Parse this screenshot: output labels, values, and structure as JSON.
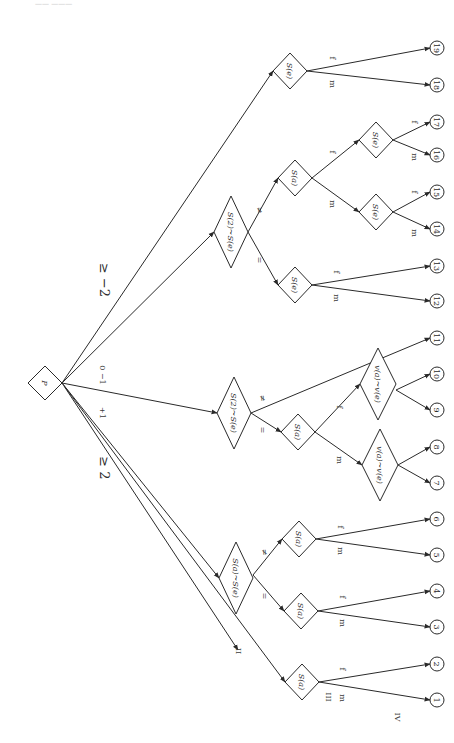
{
  "header": {
    "text": "—— ———"
  },
  "root": {
    "id": "P",
    "label": "P",
    "cx": 45,
    "cy": 383,
    "r": 17
  },
  "root_edge_labels": [
    {
      "text": "≥ −2",
      "x": 100,
      "y": 280,
      "size": "big"
    },
    {
      "text": "0  −1",
      "x": 100,
      "y": 375,
      "size": "small"
    },
    {
      "text": "+1",
      "x": 100,
      "y": 413,
      "size": "small"
    },
    {
      "text": "≥ 2",
      "x": 100,
      "y": 468,
      "size": "big"
    }
  ],
  "decision_nodes": [
    {
      "id": "n_top",
      "label": "S(e)",
      "cx": 290,
      "cy": 71,
      "rx": 17,
      "ry": 18
    },
    {
      "id": "n_upper_cmp",
      "label": "S(2)~S(e)",
      "cx": 231,
      "cy": 232,
      "rx": 17,
      "ry": 36
    },
    {
      "id": "n_upper_sa",
      "label": "S(a)",
      "cx": 295,
      "cy": 178,
      "rx": 17,
      "ry": 18
    },
    {
      "id": "n_upper_se1",
      "label": "S(e)",
      "cx": 376,
      "cy": 140,
      "rx": 17,
      "ry": 18
    },
    {
      "id": "n_upper_se2",
      "label": "S(e)",
      "cx": 376,
      "cy": 212,
      "rx": 17,
      "ry": 18
    },
    {
      "id": "n_upper_se3",
      "label": "S(e)",
      "cx": 295,
      "cy": 285,
      "rx": 17,
      "ry": 18
    },
    {
      "id": "n_mid_cmp",
      "label": "S(2)~S(e)",
      "cx": 234,
      "cy": 413,
      "rx": 17,
      "ry": 36
    },
    {
      "id": "n_mid_sa",
      "label": "S(a)",
      "cx": 298,
      "cy": 432,
      "rx": 17,
      "ry": 18
    },
    {
      "id": "n_mid_v1",
      "label": "v(a)~v(e)",
      "cx": 378,
      "cy": 384,
      "rx": 18,
      "ry": 36
    },
    {
      "id": "n_mid_v2",
      "label": "v(a)~v(e)",
      "cx": 380,
      "cy": 465,
      "rx": 18,
      "ry": 36
    },
    {
      "id": "n_low_cmp",
      "label": "S(a)~S(e)",
      "cx": 236,
      "cy": 578,
      "rx": 17,
      "ry": 36
    },
    {
      "id": "n_low_sa1",
      "label": "S(a)",
      "cx": 299,
      "cy": 539,
      "rx": 17,
      "ry": 18
    },
    {
      "id": "n_low_sa2",
      "label": "S(a)",
      "cx": 301,
      "cy": 611,
      "rx": 17,
      "ry": 18
    },
    {
      "id": "n_bottom",
      "label": "S(a)",
      "cx": 302,
      "cy": 682,
      "rx": 17,
      "ry": 18
    }
  ],
  "leaves": [
    {
      "id": "19",
      "cx": 437,
      "cy": 48
    },
    {
      "id": "18",
      "cx": 437,
      "cy": 85
    },
    {
      "id": "17",
      "cx": 437,
      "cy": 122
    },
    {
      "id": "16",
      "cx": 437,
      "cy": 155
    },
    {
      "id": "15",
      "cx": 437,
      "cy": 192
    },
    {
      "id": "14",
      "cx": 437,
      "cy": 229
    },
    {
      "id": "13",
      "cx": 437,
      "cy": 266
    },
    {
      "id": "12",
      "cx": 437,
      "cy": 301
    },
    {
      "id": "11",
      "cx": 437,
      "cy": 338
    },
    {
      "id": "10",
      "cx": 437,
      "cy": 374
    },
    {
      "id": "9",
      "cx": 437,
      "cy": 410
    },
    {
      "id": "8",
      "cx": 437,
      "cy": 447
    },
    {
      "id": "7",
      "cx": 437,
      "cy": 483
    },
    {
      "id": "6",
      "cx": 437,
      "cy": 519
    },
    {
      "id": "5",
      "cx": 437,
      "cy": 555
    },
    {
      "id": "4",
      "cx": 437,
      "cy": 591
    },
    {
      "id": "3",
      "cx": 437,
      "cy": 627
    },
    {
      "id": "2",
      "cx": 437,
      "cy": 664
    },
    {
      "id": "1",
      "cx": 437,
      "cy": 700
    }
  ],
  "edges": [
    {
      "from": [
        62,
        383
      ],
      "to": [
        273,
        71
      ]
    },
    {
      "from": [
        62,
        383
      ],
      "to": [
        214,
        232
      ]
    },
    {
      "from": [
        62,
        383
      ],
      "to": [
        217,
        413
      ]
    },
    {
      "from": [
        62,
        383
      ],
      "to": [
        219,
        578
      ]
    },
    {
      "from": [
        62,
        383
      ],
      "to": [
        285,
        682
      ]
    },
    {
      "from": [
        64,
        386
      ],
      "to": [
        238,
        650
      ]
    },
    {
      "from": [
        307,
        71
      ],
      "to": [
        430,
        48
      ],
      "label": "f",
      "lx": 330,
      "ly": 58
    },
    {
      "from": [
        307,
        71
      ],
      "to": [
        430,
        85
      ],
      "label": "m",
      "lx": 330,
      "ly": 84
    },
    {
      "from": [
        248,
        232
      ],
      "to": [
        278,
        178
      ],
      "label": "≠",
      "lx": 257,
      "ly": 210
    },
    {
      "from": [
        248,
        232
      ],
      "to": [
        278,
        285
      ],
      "label": "=",
      "lx": 257,
      "ly": 260
    },
    {
      "from": [
        312,
        178
      ],
      "to": [
        359,
        140
      ],
      "label": "f",
      "lx": 330,
      "ly": 152
    },
    {
      "from": [
        312,
        178
      ],
      "to": [
        359,
        212
      ],
      "label": "m",
      "lx": 330,
      "ly": 204
    },
    {
      "from": [
        393,
        140
      ],
      "to": [
        430,
        122
      ],
      "label": "f",
      "lx": 412,
      "ly": 122
    },
    {
      "from": [
        393,
        140
      ],
      "to": [
        430,
        155
      ],
      "label": "m",
      "lx": 412,
      "ly": 157
    },
    {
      "from": [
        393,
        212
      ],
      "to": [
        430,
        192
      ],
      "label": "f",
      "lx": 412,
      "ly": 192
    },
    {
      "from": [
        393,
        212
      ],
      "to": [
        430,
        229
      ],
      "label": "m",
      "lx": 412,
      "ly": 233
    },
    {
      "from": [
        312,
        285
      ],
      "to": [
        430,
        266
      ],
      "label": "f",
      "lx": 334,
      "ly": 272
    },
    {
      "from": [
        312,
        285
      ],
      "to": [
        430,
        301
      ],
      "label": "m",
      "lx": 334,
      "ly": 298
    },
    {
      "from": [
        251,
        413
      ],
      "to": [
        430,
        338
      ],
      "label": "≠",
      "lx": 260,
      "ly": 398
    },
    {
      "from": [
        251,
        413
      ],
      "to": [
        281,
        432
      ],
      "label": "=",
      "lx": 260,
      "ly": 430
    },
    {
      "from": [
        315,
        432
      ],
      "to": [
        360,
        384
      ],
      "label": "f",
      "lx": 337,
      "ly": 407
    },
    {
      "from": [
        315,
        432
      ],
      "to": [
        362,
        465
      ],
      "label": "m",
      "lx": 337,
      "ly": 460
    },
    {
      "from": [
        396,
        390
      ],
      "to": [
        430,
        374
      ]
    },
    {
      "from": [
        396,
        390
      ],
      "to": [
        430,
        410
      ]
    },
    {
      "from": [
        398,
        465
      ],
      "to": [
        430,
        447
      ]
    },
    {
      "from": [
        398,
        465
      ],
      "to": [
        430,
        483
      ]
    },
    {
      "from": [
        253,
        575
      ],
      "to": [
        282,
        539
      ],
      "label": "≠",
      "lx": 262,
      "ly": 552
    },
    {
      "from": [
        253,
        575
      ],
      "to": [
        284,
        611
      ],
      "label": "=",
      "lx": 262,
      "ly": 596
    },
    {
      "from": [
        316,
        539
      ],
      "to": [
        430,
        519
      ],
      "label": "f",
      "lx": 338,
      "ly": 527
    },
    {
      "from": [
        316,
        539
      ],
      "to": [
        430,
        555
      ],
      "label": "m",
      "lx": 338,
      "ly": 551
    },
    {
      "from": [
        318,
        611
      ],
      "to": [
        430,
        591
      ],
      "label": "f",
      "lx": 340,
      "ly": 597
    },
    {
      "from": [
        318,
        611
      ],
      "to": [
        430,
        627
      ],
      "label": "m",
      "lx": 340,
      "ly": 623
    },
    {
      "from": [
        319,
        682
      ],
      "to": [
        430,
        664
      ],
      "label": "f",
      "lx": 340,
      "ly": 669
    },
    {
      "from": [
        319,
        682
      ],
      "to": [
        430,
        700
      ],
      "label": "m",
      "lx": 340,
      "ly": 698
    }
  ],
  "roman_labels": [
    {
      "text": "II",
      "x": 236,
      "y": 651
    },
    {
      "text": "III",
      "x": 326,
      "y": 697
    },
    {
      "text": "IV",
      "x": 395,
      "y": 717
    }
  ]
}
